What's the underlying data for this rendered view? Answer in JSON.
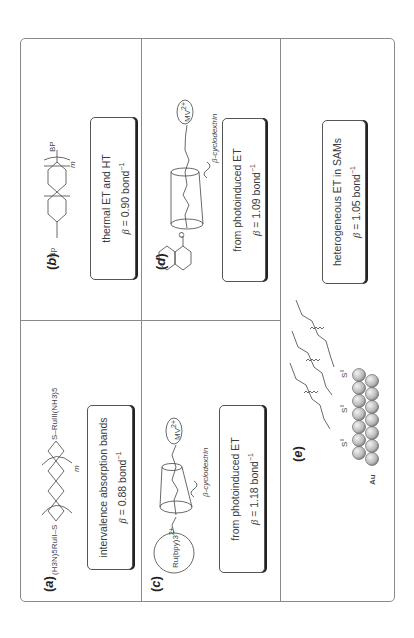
{
  "figure": {
    "orientation": "rotated 90 degrees counterclockwise",
    "panels": [
      {
        "id": "a",
        "label": "a",
        "structure_left": "(H3N)5RuII–S",
        "structure_right": "S–RuIII(NH3)5",
        "repeat_subscript": "m",
        "description": "intervalence absorption bands",
        "beta_symbol": "β",
        "beta_value": "= 0.88 bond",
        "beta_exp": "−1"
      },
      {
        "id": "b",
        "label": "b",
        "structure_left": "Np",
        "structure_right": "BP",
        "repeat_subscript": "m",
        "description": "thermal ET and HT",
        "beta_symbol": "β",
        "beta_value": "= 0.90 bond",
        "beta_exp": "−1"
      },
      {
        "id": "c",
        "label": "c",
        "donor": "Ru(bpy)3",
        "donor_charge": "2+",
        "acceptor": "MV",
        "acceptor_charge": "2+",
        "host": "β-cyclodextrin",
        "description": "from photoinduced ET",
        "beta_symbol": "β",
        "beta_value": "= 1.18 bond",
        "beta_exp": "−1"
      },
      {
        "id": "d",
        "label": "d",
        "acceptor": "MV",
        "acceptor_charge": "2+",
        "host": "β-cyclodextrin",
        "linker_atom": "O",
        "description": "from photoinduced ET",
        "beta_symbol": "β",
        "beta_value": "= 1.09 bond",
        "beta_exp": "−1"
      },
      {
        "id": "e",
        "label": "e",
        "anchor_atom": "S",
        "surface": "Au",
        "description": "heterogeneous ET in SAMs",
        "beta_symbol": "β",
        "beta_value": "= 1.05 bond",
        "beta_exp": "−1"
      }
    ]
  },
  "colors": {
    "frame": "#8a8a8a",
    "text": "#3a3a3a",
    "box_shadow": "#222222",
    "sphere": "#bdbdbd"
  }
}
